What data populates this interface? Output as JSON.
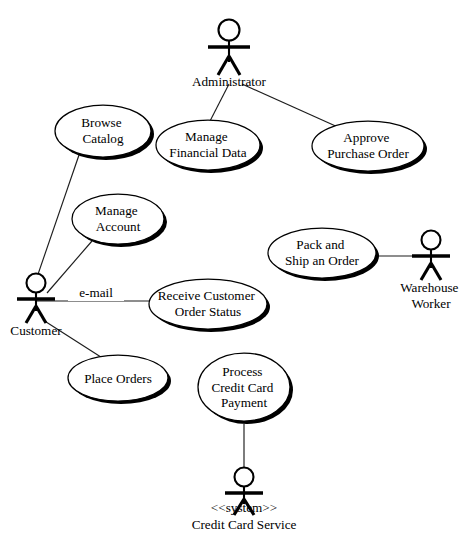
{
  "diagram": {
    "kind": "uml-use-case-diagram",
    "background_color": "#ffffff",
    "stroke_color": "#000000",
    "actors": [
      {
        "id": "administrator",
        "name": "Administrator",
        "stereotype": "",
        "label_lines": [
          "Administrator"
        ]
      },
      {
        "id": "customer",
        "name": "Customer",
        "stereotype": "",
        "label_lines": [
          "Customer"
        ]
      },
      {
        "id": "warehouse-worker",
        "name": "Warehouse Worker",
        "stereotype": "",
        "label_lines": [
          "Warehouse",
          "Worker"
        ]
      },
      {
        "id": "credit-card-service",
        "name": "Credit Card Service",
        "stereotype": "<<system>>",
        "label_lines": [
          "<<system>>",
          "Credit Card Service"
        ]
      }
    ],
    "use_cases": [
      {
        "id": "browse-catalog",
        "name": "Browse Catalog",
        "label_lines": [
          "Browse",
          "Catalog"
        ]
      },
      {
        "id": "manage-financial-data",
        "name": "Manage Financial Data",
        "label_lines": [
          "Manage",
          "Financial Data"
        ]
      },
      {
        "id": "approve-purchase-order",
        "name": "Approve Purchase Order",
        "label_lines": [
          "Approve",
          "Purchase Order"
        ]
      },
      {
        "id": "manage-account",
        "name": "Manage Account",
        "label_lines": [
          "Manage",
          "Account"
        ]
      },
      {
        "id": "pack-and-ship-an-order",
        "name": "Pack and Ship an Order",
        "label_lines": [
          "Pack and",
          "Ship an Order"
        ]
      },
      {
        "id": "receive-customer-order-status",
        "name": "Receive Customer Order Status",
        "label_lines": [
          "Receive Customer",
          "Order Status"
        ]
      },
      {
        "id": "place-orders",
        "name": "Place Orders",
        "label_lines": [
          "Place Orders"
        ]
      },
      {
        "id": "process-credit-card-payment",
        "name": "Process Credit Card Payment",
        "label_lines": [
          "Process",
          "Credit Card",
          "Payment"
        ]
      }
    ],
    "associations": [
      {
        "id": "admin-manage-financial-data",
        "from": "administrator",
        "to": "manage-financial-data",
        "label": ""
      },
      {
        "id": "admin-approve-purchase-order",
        "from": "administrator",
        "to": "approve-purchase-order",
        "label": ""
      },
      {
        "id": "customer-browse-catalog",
        "from": "customer",
        "to": "browse-catalog",
        "label": ""
      },
      {
        "id": "customer-manage-account",
        "from": "customer",
        "to": "manage-account",
        "label": ""
      },
      {
        "id": "customer-receive-order-status",
        "from": "customer",
        "to": "receive-customer-order-status",
        "label": "e-mail"
      },
      {
        "id": "customer-place-orders",
        "from": "customer",
        "to": "place-orders",
        "label": ""
      },
      {
        "id": "warehouse-pack-and-ship",
        "from": "warehouse-worker",
        "to": "pack-and-ship-an-order",
        "label": ""
      },
      {
        "id": "credit-card-service-process-payment",
        "from": "credit-card-service",
        "to": "process-credit-card-payment",
        "label": ""
      }
    ],
    "edge_labels": {
      "email": "e-mail"
    }
  }
}
